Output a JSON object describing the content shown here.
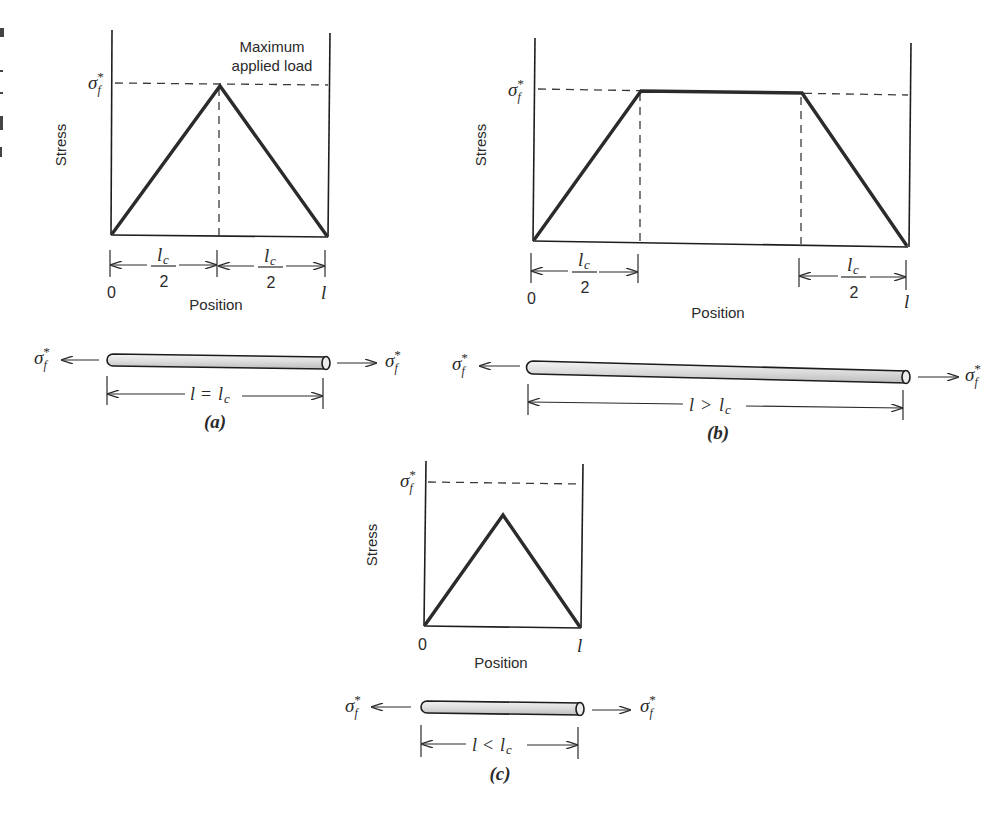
{
  "figure": {
    "panels": [
      {
        "id": "a",
        "caption": "(a)",
        "y_axis_label": "Stress",
        "x_axis_label": "Position",
        "y_max_label": "σf*",
        "x_start_label": "0",
        "x_end_label": "l",
        "annotation": [
          "Maximum",
          "applied load"
        ],
        "dimension_left": {
          "num": "lc",
          "den": "2"
        },
        "dimension_right": {
          "num": "lc",
          "den": "2"
        },
        "rod_length_label": "l = lc",
        "force_left": "σf*",
        "force_right": "σf*",
        "profile": "triangle peaking at σf* at midpoint"
      },
      {
        "id": "b",
        "caption": "(b)",
        "y_axis_label": "Stress",
        "x_axis_label": "Position",
        "y_max_label": "σf*",
        "x_start_label": "0",
        "x_end_label": "l",
        "dimension_left": {
          "num": "lc",
          "den": "2"
        },
        "dimension_right": {
          "num": "lc",
          "den": "2"
        },
        "rod_length_label": "l > lc",
        "force_left": "σf*",
        "force_right": "σf*",
        "profile": "trapezoid: linear rise over lc/2, plateau at σf*, linear fall over lc/2"
      },
      {
        "id": "c",
        "caption": "(c)",
        "y_axis_label": "Stress",
        "x_axis_label": "Position",
        "y_max_label": "σf*",
        "x_start_label": "0",
        "x_end_label": "l",
        "rod_length_label": "l < lc",
        "force_left": "σf*",
        "force_right": "σf*",
        "profile": "triangle peaking below σf* at midpoint"
      }
    ]
  },
  "symbols": {
    "sigma": "σ",
    "f": "f",
    "star": "*",
    "l": "l",
    "c": "c",
    "eq": "=",
    "gt": ">",
    "lt": "<"
  },
  "colors": {
    "ink": "#2a2a2a",
    "rod_fill_light": "#f2f2f2",
    "rod_fill_dark": "#c9c9c9",
    "background": "#ffffff"
  }
}
